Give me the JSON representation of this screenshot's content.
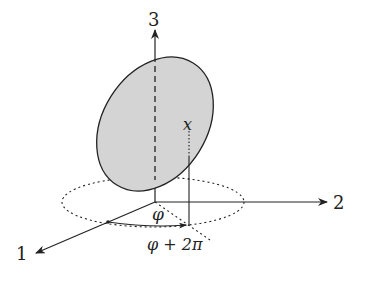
{
  "diagram": {
    "axes": {
      "axis_1_label": "1",
      "axis_2_label": "2",
      "axis_3_label": "3"
    },
    "point_label": "x",
    "angle_label": "φ",
    "angle_shift_label": "φ + 2π",
    "colors": {
      "ink": "#222222",
      "disk_fill": "#d4d4d4",
      "background": "#ffffff"
    }
  }
}
